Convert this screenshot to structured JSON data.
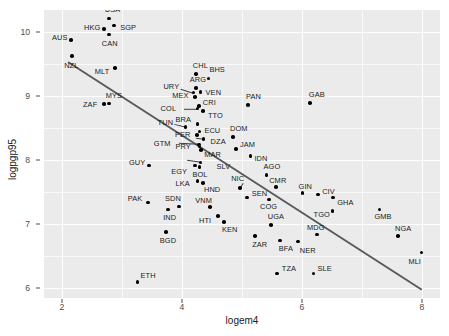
{
  "chart_data": {
    "type": "scatter",
    "title": "",
    "xlabel": "logem4",
    "ylabel": "logpgp95",
    "xlim": [
      1.7,
      8.3
    ],
    "ylim": [
      5.85,
      10.35
    ],
    "xticks": [
      2,
      4,
      6,
      8
    ],
    "yticks": [
      6,
      7,
      8,
      9,
      10
    ],
    "xticks_minor": [
      3,
      5,
      7
    ],
    "yticks_minor": [
      6.5,
      7.5,
      8.5,
      9.5
    ],
    "grid": true,
    "legend": "none",
    "panel_background": "#ebebeb",
    "grid_color": "#ffffff",
    "point_color": "#000000",
    "fit_line_color": "#5a5a5a",
    "fit_line": {
      "x_start": 2.1,
      "y_start": 9.56,
      "x_end": 8.0,
      "y_end": 6.0
    },
    "points": [
      {
        "label": "AUS",
        "x": 2.15,
        "y": 9.88,
        "lx": -19,
        "ly": -2
      },
      {
        "label": "NZL",
        "x": 2.17,
        "y": 9.63,
        "lx": -8,
        "ly": 10
      },
      {
        "label": "HKG",
        "x": 2.7,
        "y": 10.05,
        "lx": -20,
        "ly": -1
      },
      {
        "label": "USA",
        "x": 2.78,
        "y": 10.22,
        "lx": -4,
        "ly": -8
      },
      {
        "label": "CAN",
        "x": 2.78,
        "y": 9.97,
        "lx": -7,
        "ly": 10
      },
      {
        "label": "SGP",
        "x": 2.87,
        "y": 10.11,
        "lx": 6,
        "ly": 3
      },
      {
        "label": "MLT",
        "x": 2.88,
        "y": 9.44,
        "lx": -20,
        "ly": 4
      },
      {
        "label": "MYS",
        "x": 2.78,
        "y": 8.89,
        "lx": -3,
        "ly": -7
      },
      {
        "label": "ZAF",
        "x": 2.7,
        "y": 8.88,
        "lx": -21,
        "ly": 1
      },
      {
        "label": "CHL",
        "x": 4.23,
        "y": 9.35,
        "lx": -3,
        "ly": -8
      },
      {
        "label": "BHS",
        "x": 4.44,
        "y": 9.28,
        "lx": 1,
        "ly": -8
      },
      {
        "label": "ARG",
        "x": 4.23,
        "y": 9.13,
        "lx": -6,
        "ly": -8
      },
      {
        "label": "URY",
        "x": 4.19,
        "y": 9.06,
        "lx": -30,
        "ly": -6,
        "seg": [
          -12,
          -4
        ]
      },
      {
        "label": "VEN",
        "x": 4.31,
        "y": 9.07,
        "lx": 5,
        "ly": 1
      },
      {
        "label": "MEX",
        "x": 4.22,
        "y": 8.99,
        "lx": -23,
        "ly": -1
      },
      {
        "label": "CRI",
        "x": 4.28,
        "y": 8.85,
        "lx": 4,
        "ly": -3
      },
      {
        "label": "COL",
        "x": 4.26,
        "y": 8.81,
        "lx": -37,
        "ly": 0,
        "seg": [
          -14,
          0
        ]
      },
      {
        "label": "TTO",
        "x": 4.35,
        "y": 8.77,
        "lx": 5,
        "ly": 5
      },
      {
        "label": "BRA",
        "x": 4.26,
        "y": 8.57,
        "lx": -22,
        "ly": -4
      },
      {
        "label": "TUN",
        "x": 4.06,
        "y": 8.52,
        "lx": -28,
        "ly": -4,
        "seg": [
          -12,
          -3
        ]
      },
      {
        "label": "ECU",
        "x": 4.29,
        "y": 8.45,
        "lx": 5,
        "ly": -1
      },
      {
        "label": "PAN",
        "x": 5.1,
        "y": 8.87,
        "lx": -2,
        "ly": -8
      },
      {
        "label": "GAB",
        "x": 6.13,
        "y": 8.9,
        "lx": -1,
        "ly": -8
      },
      {
        "label": "DOM",
        "x": 4.85,
        "y": 8.37,
        "lx": -3,
        "ly": -8
      },
      {
        "label": "PER",
        "x": 4.25,
        "y": 8.4,
        "lx": -22,
        "ly": 0
      },
      {
        "label": "DZA",
        "x": 4.36,
        "y": 8.33,
        "lx": 7,
        "ly": 3,
        "seg": [
          -8,
          -1
        ]
      },
      {
        "label": "JAM",
        "x": 4.9,
        "y": 8.18,
        "lx": 4,
        "ly": -4
      },
      {
        "label": "GTM",
        "x": 4.28,
        "y": 8.25,
        "lx": -45,
        "ly": 0,
        "seg": [
          -20,
          -1
        ]
      },
      {
        "label": "PRY",
        "x": 4.29,
        "y": 8.22,
        "lx": -24,
        "ly": 1
      },
      {
        "label": "MAR",
        "x": 4.32,
        "y": 8.16,
        "lx": 3,
        "ly": 5
      },
      {
        "label": "IDN",
        "x": 5.14,
        "y": 8.07,
        "lx": 4,
        "ly": 3
      },
      {
        "label": "GUY",
        "x": 3.45,
        "y": 7.92,
        "lx": -20,
        "ly": -3
      },
      {
        "label": "SLV",
        "x": 4.31,
        "y": 7.97,
        "lx": 16,
        "ly": 5,
        "seg": [
          -14,
          -2
        ]
      },
      {
        "label": "EGY",
        "x": 4.22,
        "y": 7.92,
        "lx": -24,
        "ly": 6
      },
      {
        "label": "BOL",
        "x": 4.29,
        "y": 7.9,
        "lx": -7,
        "ly": 8
      },
      {
        "label": "AGO",
        "x": 5.41,
        "y": 7.77,
        "lx": -3,
        "ly": -8
      },
      {
        "label": "LKA",
        "x": 4.26,
        "y": 7.68,
        "lx": -22,
        "ly": 3
      },
      {
        "label": "HND",
        "x": 4.35,
        "y": 7.65,
        "lx": 1,
        "ly": 7
      },
      {
        "label": "NIC",
        "x": 4.97,
        "y": 7.57,
        "lx": -9,
        "ly": -9,
        "seg": [
          3,
          -5
        ]
      },
      {
        "label": "CMR",
        "x": 5.57,
        "y": 7.58,
        "lx": -7,
        "ly": -6
      },
      {
        "label": "GIN",
        "x": 6.01,
        "y": 7.49,
        "lx": -4,
        "ly": -6
      },
      {
        "label": "CIV",
        "x": 6.27,
        "y": 7.47,
        "lx": 4,
        "ly": -2
      },
      {
        "label": "SEN",
        "x": 5.08,
        "y": 7.42,
        "lx": 5,
        "ly": -4
      },
      {
        "label": "GHA",
        "x": 6.52,
        "y": 7.42,
        "lx": 4,
        "ly": 5
      },
      {
        "label": "SDN",
        "x": 3.95,
        "y": 7.28,
        "lx": -14,
        "ly": -7
      },
      {
        "label": "PAK",
        "x": 3.43,
        "y": 7.34,
        "lx": -20,
        "ly": -4
      },
      {
        "label": "IND",
        "x": 3.77,
        "y": 7.23,
        "lx": -5,
        "ly": 8
      },
      {
        "label": "VNM",
        "x": 4.47,
        "y": 7.27,
        "lx": -15,
        "ly": -6
      },
      {
        "label": "COG",
        "x": 5.45,
        "y": 7.39,
        "lx": -9,
        "ly": 8
      },
      {
        "label": "TGO",
        "x": 6.51,
        "y": 7.21,
        "lx": -19,
        "ly": 4
      },
      {
        "label": "GMB",
        "x": 7.29,
        "y": 7.23,
        "lx": -5,
        "ly": 7
      },
      {
        "label": "HTI",
        "x": 4.6,
        "y": 7.13,
        "lx": -19,
        "ly": 5
      },
      {
        "label": "KEN",
        "x": 4.7,
        "y": 7.04,
        "lx": -2,
        "ly": 8
      },
      {
        "label": "UGA",
        "x": 5.48,
        "y": 6.99,
        "lx": -3,
        "ly": -8
      },
      {
        "label": "BGD",
        "x": 3.73,
        "y": 6.88,
        "lx": -6,
        "ly": 9
      },
      {
        "label": "MDG",
        "x": 6.25,
        "y": 6.84,
        "lx": -10,
        "ly": -7
      },
      {
        "label": "NGA",
        "x": 7.6,
        "y": 6.82,
        "lx": -3,
        "ly": -7
      },
      {
        "label": "ZAR",
        "x": 5.22,
        "y": 6.82,
        "lx": -3,
        "ly": 9
      },
      {
        "label": "BFA",
        "x": 5.63,
        "y": 6.75,
        "lx": -1,
        "ly": 9
      },
      {
        "label": "NER",
        "x": 5.93,
        "y": 6.73,
        "lx": 2,
        "ly": 9
      },
      {
        "label": "MLI",
        "x": 7.99,
        "y": 6.56,
        "lx": -13,
        "ly": 9
      },
      {
        "label": "TZA",
        "x": 5.58,
        "y": 6.23,
        "lx": 5,
        "ly": -5
      },
      {
        "label": "SLE",
        "x": 6.19,
        "y": 6.23,
        "lx": 4,
        "ly": -5
      },
      {
        "label": "ETH",
        "x": 3.26,
        "y": 6.1,
        "lx": 3,
        "ly": -6
      }
    ]
  }
}
